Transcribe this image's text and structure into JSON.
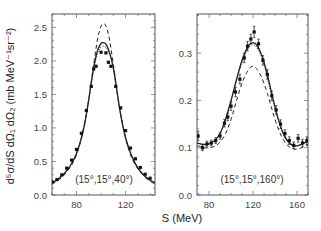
{
  "figure": {
    "ylabel": "d⁵σ/dS dΩ₁ dΩ₂  (mb MeV⁻¹sr⁻²)",
    "xlabel": "S  (MeV)"
  },
  "chart_data": [
    {
      "type": "line",
      "panel": "left",
      "annotation": "(15°,15°,40°)",
      "xlabel": "S (MeV)",
      "ylabel": "d^5σ/dS dΩ_1 dΩ_2 (mb MeV^-1 sr^-2)",
      "xlim": [
        60,
        144
      ],
      "ylim": [
        0.0,
        2.7
      ],
      "xticks": [
        80,
        120
      ],
      "yticks": [
        0.0,
        0.5,
        1.0,
        1.5,
        2.0,
        2.5
      ],
      "ytick_labels": [
        "0.0",
        "0.5",
        "1.0",
        "1.5",
        "2.0",
        "2.5"
      ],
      "xtick_labels": [
        "80",
        "120"
      ],
      "grid": false,
      "series": [
        {
          "name": "solid",
          "style": "solid",
          "x": [
            60,
            65,
            70,
            75,
            80,
            85,
            88,
            91,
            94,
            97,
            100,
            102,
            104,
            107,
            110,
            113,
            116,
            120,
            125,
            130,
            135,
            140,
            144
          ],
          "y": [
            0.17,
            0.24,
            0.32,
            0.44,
            0.62,
            0.92,
            1.2,
            1.55,
            1.9,
            2.15,
            2.26,
            2.27,
            2.25,
            2.12,
            1.9,
            1.55,
            1.2,
            0.85,
            0.58,
            0.4,
            0.29,
            0.22,
            0.18
          ]
        },
        {
          "name": "dotted",
          "style": "dotted",
          "x": [
            60,
            70,
            80,
            88,
            94,
            98,
            102,
            106,
            110,
            116,
            124,
            134,
            144
          ],
          "y": [
            0.17,
            0.32,
            0.62,
            1.2,
            1.87,
            2.15,
            2.22,
            2.14,
            1.88,
            1.2,
            0.63,
            0.32,
            0.18
          ]
        },
        {
          "name": "dashed",
          "style": "dashed",
          "x": [
            60,
            70,
            80,
            88,
            94,
            98,
            102,
            106,
            110,
            116,
            124,
            134,
            144
          ],
          "y": [
            0.16,
            0.3,
            0.6,
            1.2,
            1.95,
            2.4,
            2.56,
            2.4,
            1.95,
            1.2,
            0.6,
            0.3,
            0.16
          ]
        },
        {
          "name": "data",
          "style": "markers",
          "x": [
            60,
            64,
            68,
            72,
            76,
            80,
            84,
            88,
            92,
            94,
            96,
            100,
            104,
            106,
            108,
            112,
            116,
            120,
            124,
            128,
            132,
            136,
            140
          ],
          "y": [
            0.2,
            0.23,
            0.3,
            0.4,
            0.52,
            0.68,
            0.92,
            1.26,
            1.62,
            1.88,
            1.92,
            2.13,
            2.12,
            1.98,
            1.92,
            1.62,
            1.3,
            0.96,
            0.7,
            0.54,
            0.41,
            0.31,
            0.25
          ]
        }
      ]
    },
    {
      "type": "line",
      "panel": "right",
      "annotation": "(15°,15°,160°)",
      "xlabel": "S (MeV)",
      "xlim": [
        69,
        170
      ],
      "ylim": [
        0.0,
        0.383
      ],
      "xticks": [
        80,
        120,
        160
      ],
      "yticks": [
        0.0,
        0.1,
        0.2,
        0.3
      ],
      "ytick_labels": [
        "0.0",
        "0.1",
        "0.2",
        "0.3"
      ],
      "xtick_labels": [
        "80",
        "120",
        "160"
      ],
      "grid": false,
      "series": [
        {
          "name": "solid",
          "style": "solid",
          "x": [
            69,
            75,
            80,
            85,
            90,
            95,
            100,
            105,
            110,
            115,
            119,
            123,
            128,
            133,
            138,
            143,
            148,
            153,
            158,
            163,
            170
          ],
          "y": [
            0.11,
            0.107,
            0.108,
            0.115,
            0.13,
            0.16,
            0.2,
            0.245,
            0.285,
            0.313,
            0.322,
            0.318,
            0.295,
            0.255,
            0.205,
            0.16,
            0.128,
            0.11,
            0.104,
            0.106,
            0.114
          ]
        },
        {
          "name": "dotted",
          "style": "dotted",
          "x": [
            69,
            80,
            90,
            100,
            110,
            119,
            128,
            138,
            148,
            158,
            170
          ],
          "y": [
            0.11,
            0.108,
            0.13,
            0.2,
            0.28,
            0.318,
            0.29,
            0.2,
            0.126,
            0.104,
            0.114
          ]
        },
        {
          "name": "dashed",
          "style": "dashed",
          "x": [
            69,
            75,
            80,
            85,
            90,
            95,
            100,
            105,
            110,
            115,
            119,
            123,
            128,
            133,
            138,
            143,
            148,
            153,
            158,
            163,
            170
          ],
          "y": [
            0.105,
            0.1,
            0.1,
            0.103,
            0.112,
            0.13,
            0.16,
            0.2,
            0.237,
            0.262,
            0.272,
            0.268,
            0.248,
            0.215,
            0.175,
            0.14,
            0.115,
            0.102,
            0.097,
            0.099,
            0.106
          ]
        },
        {
          "name": "data",
          "style": "markers-with-errorbars",
          "x": [
            70,
            74,
            78,
            82,
            86,
            90,
            94,
            97,
            100,
            104,
            108,
            112,
            115,
            118,
            121,
            125,
            129,
            133,
            137,
            141,
            145,
            149,
            153,
            157,
            161,
            165,
            169
          ],
          "y": [
            0.125,
            0.1,
            0.108,
            0.11,
            0.115,
            0.125,
            0.152,
            0.165,
            0.188,
            0.218,
            0.245,
            0.29,
            0.315,
            0.33,
            0.345,
            0.32,
            0.285,
            0.255,
            0.21,
            0.18,
            0.15,
            0.13,
            0.115,
            0.105,
            0.12,
            0.11,
            0.115
          ],
          "yerr": [
            0.01,
            0.006,
            0.006,
            0.006,
            0.006,
            0.007,
            0.008,
            0.008,
            0.009,
            0.01,
            0.01,
            0.01,
            0.01,
            0.01,
            0.012,
            0.01,
            0.01,
            0.01,
            0.01,
            0.009,
            0.009,
            0.008,
            0.008,
            0.007,
            0.008,
            0.008,
            0.008
          ]
        }
      ]
    }
  ]
}
